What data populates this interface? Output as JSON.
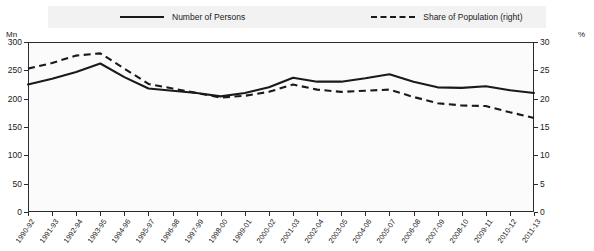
{
  "chart_data": {
    "type": "line",
    "title": "",
    "xlabel": "",
    "ylabel": "Mn",
    "y2label": "%",
    "grid": false,
    "legend_position": "top",
    "ylim": [
      0,
      300
    ],
    "y2lim": [
      0,
      30
    ],
    "yticks": [
      0,
      50,
      100,
      150,
      200,
      250,
      300
    ],
    "y2ticks": [
      0,
      5,
      10,
      15,
      20,
      25,
      30
    ],
    "categories": [
      "1990-92",
      "1991-93",
      "1992-94",
      "1993-95",
      "1994-96",
      "1995-97",
      "1996-98",
      "1997-99",
      "1998-00",
      "1999-01",
      "2000-02",
      "2001-03",
      "2002-04",
      "2003-05",
      "2004-06",
      "2005-07",
      "2006-08",
      "2007-09",
      "2008-10",
      "2009-11",
      "2010-12",
      "2011-13"
    ],
    "series": [
      {
        "name": "Number of Persons",
        "axis": "left",
        "style": "solid",
        "unit": "Mn",
        "values": [
          225,
          235,
          247,
          262,
          238,
          218,
          214,
          210,
          204,
          210,
          220,
          237,
          230,
          230,
          236,
          243,
          230,
          220,
          219,
          222,
          215,
          210
        ]
      },
      {
        "name": "Share of Population (right)",
        "axis": "right",
        "style": "dashed",
        "unit": "%",
        "values": [
          25.3,
          26.3,
          27.6,
          28.0,
          25.3,
          22.6,
          21.8,
          21.0,
          20.2,
          20.5,
          21.2,
          22.5,
          21.6,
          21.2,
          21.4,
          21.6,
          20.3,
          19.2,
          18.8,
          18.7,
          17.6,
          16.6
        ]
      }
    ],
    "legend": [
      {
        "label": "Number of Persons",
        "style": "solid"
      },
      {
        "label": "Share of Population (right)",
        "style": "dashed"
      }
    ],
    "axis_units": {
      "left": "Mn",
      "right": "%"
    }
  }
}
